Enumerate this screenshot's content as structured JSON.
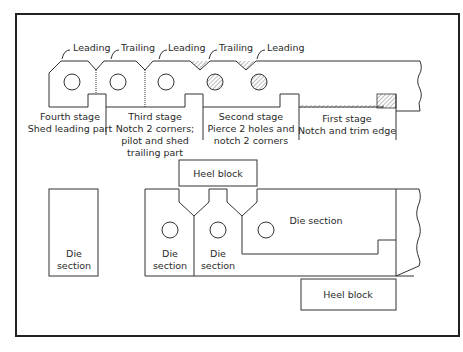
{
  "figure": {
    "strip": {
      "edge_callouts": [
        {
          "label": "Leading",
          "x": 72,
          "y": 48
        },
        {
          "label": "Trailing",
          "x": 120,
          "y": 48
        },
        {
          "label": "Leading",
          "x": 167,
          "y": 48
        },
        {
          "label": "Trailing",
          "x": 218,
          "y": 48
        },
        {
          "label": "Leading",
          "x": 266,
          "y": 48
        }
      ],
      "stages": [
        {
          "name": "Fourth stage",
          "lines": [
            "Fourth stage",
            "Shed leading part"
          ]
        },
        {
          "name": "Third stage",
          "lines": [
            "Third stage",
            "Notch 2 corners;",
            "pilot and shed",
            "trailing part"
          ]
        },
        {
          "name": "Second stage",
          "lines": [
            "Second stage",
            "Pierce 2 holes and",
            "notch 2 corners"
          ]
        },
        {
          "name": "First stage",
          "lines": [
            "First stage",
            "Notch and trim edge"
          ]
        }
      ]
    },
    "die_layout": {
      "labels": {
        "heel_block_top": "Heel block",
        "heel_block_bottom": "Heel block",
        "die_section_left": [
          "Die",
          "section"
        ],
        "die_section_1": [
          "Die",
          "section"
        ],
        "die_section_2": [
          "Die",
          "section"
        ],
        "die_section_long": "Die section"
      }
    }
  }
}
